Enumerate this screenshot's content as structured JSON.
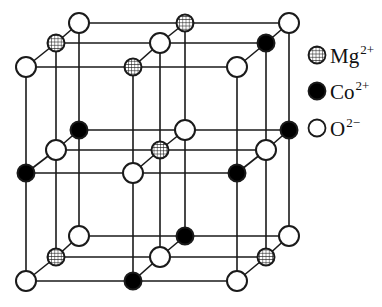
{
  "diagram": {
    "type": "crystal-lattice",
    "colors": {
      "line": "#1a1a1a",
      "co_fill": "#000000",
      "o_fill": "#ffffff",
      "mg_fill": "#ffffff"
    },
    "atom_radius": 10,
    "layers": [
      {
        "name": "top",
        "rows": [
          {
            "name": "back",
            "atoms": [
              {
                "x": 79,
                "y": 23,
                "type": "O"
              },
              {
                "x": 185,
                "y": 23,
                "type": "Mg"
              },
              {
                "x": 289,
                "y": 23,
                "type": "O"
              }
            ]
          },
          {
            "name": "middle",
            "atoms": [
              {
                "x": 56,
                "y": 43,
                "type": "Mg"
              },
              {
                "x": 160,
                "y": 43,
                "type": "O"
              },
              {
                "x": 266,
                "y": 43,
                "type": "Co"
              }
            ]
          },
          {
            "name": "front",
            "atoms": [
              {
                "x": 26,
                "y": 67,
                "type": "O"
              },
              {
                "x": 133,
                "y": 67,
                "type": "Mg"
              },
              {
                "x": 237,
                "y": 67,
                "type": "O"
              }
            ]
          }
        ]
      },
      {
        "name": "middle",
        "rows": [
          {
            "name": "back",
            "atoms": [
              {
                "x": 79,
                "y": 130,
                "type": "Co"
              },
              {
                "x": 185,
                "y": 130,
                "type": "O"
              },
              {
                "x": 289,
                "y": 130,
                "type": "Co"
              }
            ]
          },
          {
            "name": "middle",
            "atoms": [
              {
                "x": 56,
                "y": 150,
                "type": "O"
              },
              {
                "x": 160,
                "y": 150,
                "type": "Mg"
              },
              {
                "x": 266,
                "y": 150,
                "type": "O"
              }
            ]
          },
          {
            "name": "front",
            "atoms": [
              {
                "x": 26,
                "y": 173,
                "type": "Co"
              },
              {
                "x": 133,
                "y": 173,
                "type": "O"
              },
              {
                "x": 237,
                "y": 173,
                "type": "Co"
              }
            ]
          }
        ]
      },
      {
        "name": "bottom",
        "rows": [
          {
            "name": "back",
            "atoms": [
              {
                "x": 79,
                "y": 236,
                "type": "O"
              },
              {
                "x": 185,
                "y": 236,
                "type": "Co"
              },
              {
                "x": 289,
                "y": 236,
                "type": "O"
              }
            ]
          },
          {
            "name": "middle",
            "atoms": [
              {
                "x": 56,
                "y": 257,
                "type": "Mg"
              },
              {
                "x": 160,
                "y": 257,
                "type": "O"
              },
              {
                "x": 266,
                "y": 257,
                "type": "Mg"
              }
            ]
          },
          {
            "name": "front",
            "atoms": [
              {
                "x": 26,
                "y": 281,
                "type": "O"
              },
              {
                "x": 133,
                "y": 281,
                "type": "Co"
              },
              {
                "x": 237,
                "y": 281,
                "type": "O"
              }
            ]
          }
        ]
      }
    ]
  },
  "legend": {
    "items": [
      {
        "type": "Mg",
        "icon": "hatched-circle-icon",
        "symbol": "Mg",
        "charge": "2+",
        "y": 43
      },
      {
        "type": "Co",
        "icon": "filled-circle-icon",
        "symbol": "Co",
        "charge": "2+",
        "y": 79
      },
      {
        "type": "O",
        "icon": "open-circle-icon",
        "symbol": "O",
        "charge": "2−",
        "y": 116
      }
    ]
  }
}
